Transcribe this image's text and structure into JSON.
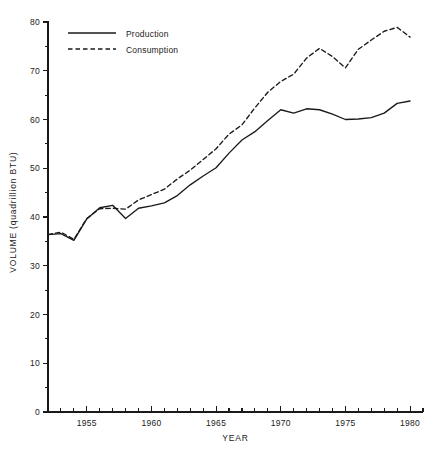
{
  "chart_data": {
    "type": "line",
    "title": "",
    "xlabel": "YEAR",
    "ylabel": "VOLUME (quadrillion BTU)",
    "xlim": [
      1952,
      1981
    ],
    "ylim": [
      0,
      80
    ],
    "grid": false,
    "legend_position": "top-left",
    "x_major_ticks": [
      1955,
      1960,
      1965,
      1970,
      1975,
      1980
    ],
    "x_major_tick_labels": [
      "1955",
      "1960",
      "1965",
      "1970",
      "1975",
      "1980"
    ],
    "x_minor_tick_step": 1,
    "y_major_ticks": [
      0,
      10,
      20,
      30,
      40,
      50,
      60,
      70,
      80
    ],
    "y_major_tick_labels": [
      "0",
      "10",
      "20",
      "30",
      "40",
      "50",
      "60",
      "70",
      "80"
    ],
    "y_minor_ticks": [
      5,
      15,
      25,
      35,
      45,
      55,
      65,
      75
    ],
    "x": [
      1952,
      1953,
      1954,
      1955,
      1956,
      1957,
      1958,
      1959,
      1960,
      1961,
      1962,
      1963,
      1964,
      1965,
      1966,
      1967,
      1968,
      1969,
      1970,
      1971,
      1972,
      1973,
      1974,
      1975,
      1976,
      1977,
      1978,
      1979,
      1980
    ],
    "series": [
      {
        "name": "Production",
        "style": "solid",
        "values": [
          36.4,
          36.6,
          35.2,
          39.6,
          41.9,
          42.4,
          39.7,
          41.8,
          42.3,
          42.9,
          44.4,
          46.6,
          48.4,
          50.1,
          53.1,
          55.8,
          57.5,
          59.8,
          62.0,
          61.3,
          62.2,
          62.0,
          61.1,
          60.0,
          60.1,
          60.4,
          61.3,
          63.3,
          63.8
        ]
      },
      {
        "name": "Consumption",
        "style": "dashed",
        "values": [
          36.4,
          36.9,
          35.4,
          39.7,
          41.7,
          41.8,
          41.6,
          43.5,
          44.6,
          45.7,
          47.8,
          49.6,
          51.8,
          54.0,
          57.0,
          58.9,
          62.4,
          65.6,
          67.8,
          69.3,
          72.6,
          74.6,
          72.9,
          70.6,
          74.4,
          76.3,
          78.1,
          78.9,
          76.9
        ]
      }
    ]
  },
  "legend": {
    "items": [
      {
        "label": "Production",
        "style": "solid"
      },
      {
        "label": "Consumption",
        "style": "dashed"
      }
    ]
  }
}
